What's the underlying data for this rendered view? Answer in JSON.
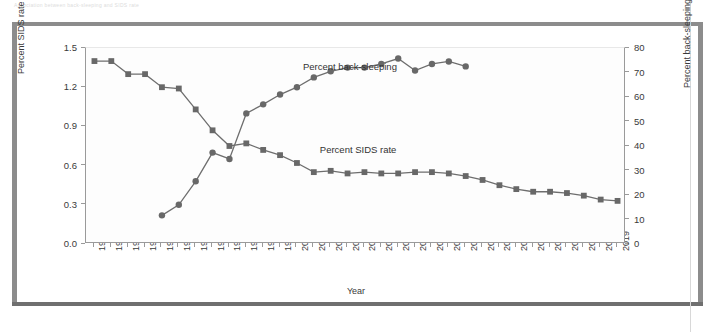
{
  "figure": {
    "caption_ghost": "Association between back-sleeping and SIDS rate"
  },
  "axes": {
    "x_title": "Year",
    "y_left_title": "Percent SIDS rate",
    "y_right_title": "Percent back-sleeping"
  },
  "labels": {
    "back_sleeping": "Percent back-sleeping",
    "sids_rate": "Percent SIDS rate"
  },
  "colors": {
    "series_line": "#6e6e6e",
    "marker": "#686868",
    "axis": "#9a9a9a",
    "frame": "#8c8c8c",
    "text": "#3a3a3a"
  },
  "chart_data": {
    "type": "line",
    "title": "",
    "xlabel": "Year",
    "ylabel": "Percent SIDS rate",
    "y2label": "Percent back-sleeping",
    "grid": false,
    "legend_position": "inline-annotation",
    "categories": [
      "1988",
      "1989",
      "1990",
      "1991",
      "1992",
      "1993",
      "1994",
      "1995",
      "1996",
      "1997",
      "1998",
      "1999",
      "2000",
      "2001",
      "2002",
      "2003",
      "2004",
      "2005",
      "2006",
      "2007",
      "2008",
      "2009",
      "2010",
      "2011",
      "2012",
      "2013",
      "2014",
      "2015",
      "2016",
      "2017",
      "2018",
      "2019"
    ],
    "ylim": [
      0.0,
      1.5
    ],
    "yticks": [
      "0.0",
      "0.3",
      "0.6",
      "0.9",
      "1.2",
      "1.5"
    ],
    "y2lim": [
      0,
      80
    ],
    "y2ticks": [
      "0",
      "10",
      "20",
      "30",
      "40",
      "50",
      "60",
      "70",
      "80"
    ],
    "series": [
      {
        "name": "Percent SIDS rate",
        "axis": "left",
        "marker": "square",
        "values": [
          1.4,
          1.4,
          1.3,
          1.3,
          1.2,
          1.19,
          1.03,
          0.87,
          0.75,
          0.77,
          0.72,
          0.68,
          0.62,
          0.55,
          0.56,
          0.54,
          0.55,
          0.54,
          0.54,
          0.55,
          0.55,
          0.54,
          0.52,
          0.49,
          0.45,
          0.42,
          0.4,
          0.4,
          0.39,
          0.37,
          0.34,
          0.33
        ]
      },
      {
        "name": "Percent back-sleeping",
        "axis": "right",
        "marker": "circle",
        "values": [
          null,
          null,
          null,
          null,
          11.7,
          16.0,
          25.6,
          37.3,
          34.7,
          53.3,
          57.0,
          61.0,
          64.0,
          68.0,
          70.5,
          72.0,
          72.0,
          73.5,
          75.7,
          70.8,
          73.5,
          74.5,
          72.5,
          null,
          null,
          null,
          null,
          null,
          null,
          null,
          null,
          null
        ]
      }
    ]
  }
}
